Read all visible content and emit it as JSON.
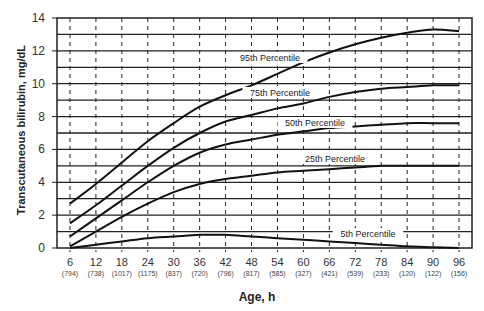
{
  "chart_data": {
    "type": "line",
    "title": "",
    "xlabel": "Age, h",
    "ylabel": "Transcutaneous bilirubin, mg/dL",
    "x": [
      6,
      12,
      18,
      24,
      30,
      36,
      42,
      48,
      54,
      60,
      66,
      72,
      78,
      84,
      90,
      96
    ],
    "x_tick_labels": [
      "6",
      "12",
      "18",
      "24",
      "30",
      "36",
      "42",
      "48",
      "54",
      "60",
      "66",
      "72",
      "78",
      "84",
      "90",
      "96"
    ],
    "x_tick_sublabels": [
      "(794)",
      "(738)",
      "(1017)",
      "(1175)",
      "(837)",
      "(720)",
      "(796)",
      "(817)",
      "(585)",
      "(327)",
      "(421)",
      "(539)",
      "(233)",
      "(120)",
      "(122)",
      "(156)"
    ],
    "y_ticks": [
      0,
      2,
      4,
      6,
      8,
      10,
      12,
      14
    ],
    "ylim": [
      0,
      14
    ],
    "xlim": [
      3,
      99
    ],
    "grid": {
      "horizontal": true,
      "horizontal_step": 1,
      "vertical_dashed": true
    },
    "legend": "inline labels on curves",
    "series": [
      {
        "name": "95th Percentile",
        "values": [
          2.7,
          3.9,
          5.2,
          6.5,
          7.6,
          8.6,
          9.3,
          9.9,
          10.6,
          11.3,
          11.9,
          12.4,
          12.8,
          13.1,
          13.3,
          13.2
        ],
        "label_pos": [
          270,
          60
        ]
      },
      {
        "name": "75th Percentile",
        "values": [
          1.5,
          2.6,
          3.8,
          5.0,
          6.1,
          7.0,
          7.7,
          8.1,
          8.5,
          8.8,
          9.2,
          9.5,
          9.7,
          9.8,
          9.9,
          9.9
        ],
        "label_pos": [
          280,
          95
        ]
      },
      {
        "name": "50th Percentile",
        "values": [
          0.7,
          1.8,
          2.9,
          4.0,
          5.0,
          5.8,
          6.3,
          6.6,
          6.9,
          7.1,
          7.3,
          7.4,
          7.5,
          7.6,
          7.6,
          7.6
        ],
        "label_pos": [
          315,
          125
        ]
      },
      {
        "name": "25th Percentile",
        "values": [
          0.1,
          1.0,
          1.9,
          2.7,
          3.4,
          3.9,
          4.2,
          4.4,
          4.6,
          4.7,
          4.8,
          4.9,
          5.0,
          5.0,
          5.0,
          5.0
        ],
        "label_pos": [
          335,
          161
        ]
      },
      {
        "name": "5th Percentile",
        "values": [
          0.0,
          0.2,
          0.4,
          0.6,
          0.7,
          0.8,
          0.8,
          0.7,
          0.6,
          0.5,
          0.4,
          0.3,
          0.2,
          0.1,
          0.05,
          0.0
        ],
        "label_pos": [
          368,
          236
        ]
      }
    ]
  }
}
